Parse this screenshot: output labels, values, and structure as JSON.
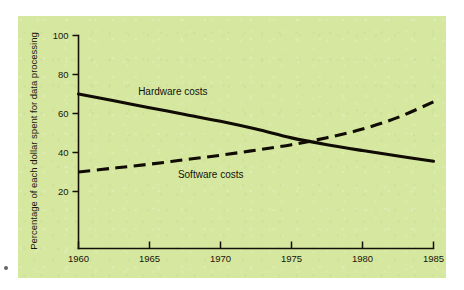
{
  "figure": {
    "panel_color": "#d6e8a0",
    "background_color": "#ffffff",
    "ink_color": "#100c04",
    "corner_mark_name": "page-margin-mark"
  },
  "chart_data": {
    "type": "line",
    "title": "",
    "xlabel": "",
    "ylabel": "Percentage of each dollar spent for data processing",
    "xlim": [
      1960,
      1985
    ],
    "ylim": [
      0,
      100
    ],
    "xticks": [
      1960,
      1965,
      1970,
      1975,
      1980,
      1985
    ],
    "xticklabels": [
      "1960",
      "1965",
      "1970",
      "1975",
      "1980",
      "1985"
    ],
    "yticks": [
      20,
      40,
      60,
      80,
      100
    ],
    "yticklabels": [
      "20",
      "40",
      "60",
      "80",
      "100"
    ],
    "grid": false,
    "legend": "inline-annotations",
    "x": [
      1960,
      1962.5,
      1965,
      1967.5,
      1970,
      1972.5,
      1975,
      1977.5,
      1980,
      1982.5,
      1985
    ],
    "series": [
      {
        "name": "Hardware costs",
        "style": "solid",
        "label_x": 1964.2,
        "label_y": 69.5,
        "values": [
          70,
          66.5,
          63,
          59.5,
          56,
          52,
          47.5,
          44,
          41,
          38.2,
          35.5
        ]
      },
      {
        "name": "Software costs",
        "style": "dashed",
        "label_x": 1967.0,
        "label_y": 27.0,
        "values": [
          30,
          32,
          34,
          36.3,
          38.6,
          41.2,
          44,
          47.6,
          52,
          58,
          66
        ]
      }
    ],
    "annotations": [
      {
        "text": "Hardware costs",
        "x": 1964.2,
        "y": 69.5
      },
      {
        "text": "Software costs",
        "x": 1967.0,
        "y": 27.0
      }
    ],
    "crossing_point": {
      "x": 1974.4,
      "y": 45.5
    }
  }
}
